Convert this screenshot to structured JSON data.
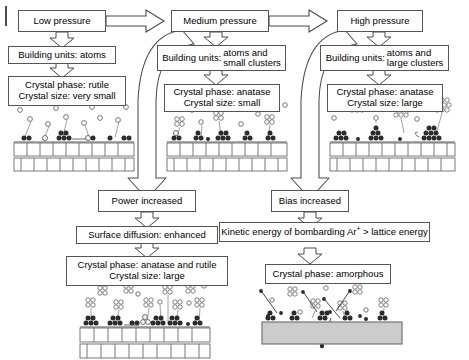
{
  "figure": {
    "type": "process-flow-diagram",
    "columns": 3,
    "rows": 2
  },
  "colors": {
    "box_border": "#555555",
    "box_fill": "#ffffff",
    "arrow_stroke": "#4a4a4a",
    "arrow_fill": "#ffffff",
    "lattice_stroke": "#6a6a6a",
    "amorphous_fill": "#cccccc",
    "particle_dark": "#2b2b2b",
    "particle_light": "#ffffff",
    "text": "#000000"
  },
  "top_row": {
    "low": {
      "header": "Low pressure",
      "building_units_label": "Building units: atoms",
      "crystal_phase": "Crystal phase: rutile",
      "crystal_size": "Crystal size: very small"
    },
    "medium": {
      "header": "Medium pressure",
      "building_units_lead": "Building units:",
      "building_units_line1": "atoms and",
      "building_units_line2": "small clusters",
      "crystal_phase": "Crystal phase: anatase",
      "crystal_size": "Crystal size: small"
    },
    "high": {
      "header": "High pressure",
      "building_units_lead": "Building units:",
      "building_units_line1": "atoms and",
      "building_units_line2": "large clusters",
      "crystal_phase": "Crystal phase: anatase",
      "crystal_size": "Crystal size: large"
    }
  },
  "bottom_row": {
    "power": {
      "header": "Power increased",
      "mechanism": "Surface diffusion: enhanced",
      "crystal_phase": "Crystal phase: anatase and rutile",
      "crystal_size": "Crystal size: large"
    },
    "bias": {
      "header": "Bias increased",
      "mechanism_pre": "Kinetic energy of bombarding Ar",
      "mechanism_sup": "+",
      "mechanism_post": " > lattice energy",
      "crystal_phase": "Crystal phase: amorphous"
    }
  },
  "arrows": {
    "low_to_medium": "block-arrow-right",
    "medium_to_high": "block-arrow-right",
    "medium_to_power": "curved-block-arrow-down-left",
    "high_to_bias": "curved-block-arrow-down-left",
    "connector": "block-arrow-down"
  },
  "illustrations": {
    "low": {
      "name": "low-pressure-growth-illustration",
      "substrate": "crystalline-lattice",
      "incoming": "single atoms",
      "adatoms": "small dark atom pairs"
    },
    "medium": {
      "name": "medium-pressure-growth-illustration",
      "substrate": "crystalline-lattice",
      "incoming": "atoms and small clusters",
      "adatoms": "small islands"
    },
    "high": {
      "name": "high-pressure-growth-illustration",
      "substrate": "crystalline-lattice",
      "incoming": "atoms and large clusters",
      "adatoms": "large islands"
    },
    "power": {
      "name": "power-increased-growth-illustration",
      "substrate": "crystalline-lattice",
      "incoming": "atoms and clusters",
      "adatoms": "coalesced large islands"
    },
    "bias": {
      "name": "bias-increased-growth-illustration",
      "substrate": "amorphous-slab",
      "incoming": "atoms, clusters and Ar+ ions",
      "adatoms": "disordered islands"
    }
  }
}
